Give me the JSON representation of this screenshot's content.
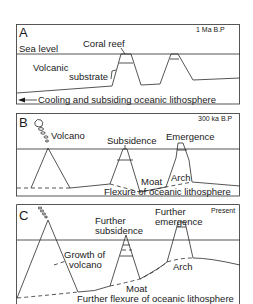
{
  "figure": {
    "panels": [
      {
        "id": "A",
        "letter": "A",
        "age": "1 Ma B.P",
        "labels": {
          "sea_level": "Sea level",
          "coral_reef": "Coral reef",
          "volcanic_line1": "Volcanic",
          "volcanic_line2": "substrate",
          "bottom": "Cooling and subsiding oceanic lithosphere"
        },
        "icons": {
          "arrow": "arrow-left-icon"
        }
      },
      {
        "id": "B",
        "letter": "B",
        "age": "300 ka B.P",
        "labels": {
          "volcano": "Volcano",
          "subsidence": "Subsidence",
          "emergence": "Emergence",
          "moat": "Moat",
          "arch": "Arch",
          "bottom": "Flexure of oceanic lithosphere"
        },
        "icons": {
          "smoke": "eruption-plume-icon"
        }
      },
      {
        "id": "C",
        "letter": "C",
        "age": "Present",
        "labels": {
          "further_subsidence_line1": "Further",
          "further_subsidence_line2": "subsidence",
          "further_emergence_line1": "Further",
          "further_emergence_line2": "emergence",
          "growth_line1": "Growth of",
          "growth_line2": "volcano",
          "moat": "Moat",
          "arch": "Arch",
          "bottom": "Further flexure of oceanic lithosphere"
        },
        "icons": {
          "smoke": "eruption-plume-icon"
        }
      }
    ]
  }
}
